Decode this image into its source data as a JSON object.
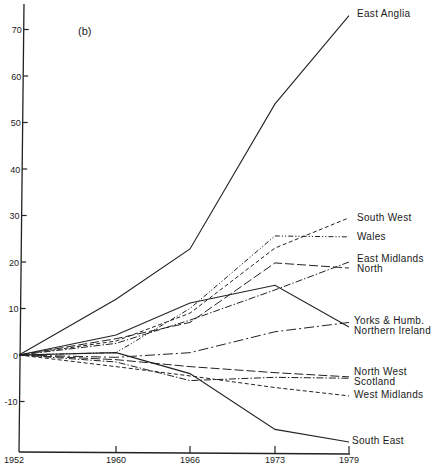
{
  "chart_data": {
    "type": "line",
    "title": "(b)",
    "xlabel": "",
    "ylabel": "",
    "x": [
      1952,
      1960,
      1966,
      1973,
      1979
    ],
    "xticks": [
      "1952",
      "1960",
      "1966",
      "1973",
      "1979"
    ],
    "yticks": [
      -10,
      0,
      10,
      20,
      30,
      40,
      50,
      60,
      70
    ],
    "ylim": [
      -20,
      76
    ],
    "grid": false,
    "legend_position": "inline-right",
    "series": [
      {
        "name": "East Anglia",
        "style": "solid",
        "values": [
          0,
          12,
          22.8,
          54,
          73
        ]
      },
      {
        "name": "South West",
        "style": "dashed-short",
        "values": [
          0,
          3,
          9,
          23,
          29.5
        ]
      },
      {
        "name": "Wales",
        "style": "dash-dot-dot",
        "values": [
          0,
          0.5,
          10,
          25.6,
          25.4
        ]
      },
      {
        "name": "East Midlands",
        "style": "dash-dot",
        "values": [
          0,
          2.5,
          7.5,
          14,
          20
        ]
      },
      {
        "name": "North",
        "style": "long-dash",
        "values": [
          0,
          3.5,
          7,
          19.8,
          18.7
        ]
      },
      {
        "name": "Yorks & Humb.",
        "style": "dash-dot-long",
        "values": [
          0,
          -0.5,
          0.5,
          5,
          7
        ]
      },
      {
        "name": "Northern Ireland",
        "style": "solid",
        "values": [
          0,
          4.3,
          11.2,
          15,
          6
        ]
      },
      {
        "name": "North West",
        "style": "long-dash",
        "values": [
          0,
          -1,
          -2.5,
          -3.8,
          -4.7
        ]
      },
      {
        "name": "Scotland",
        "style": "dash-dot",
        "values": [
          0,
          -1.5,
          -5.5,
          -4.8,
          -5
        ]
      },
      {
        "name": "West Midlands",
        "style": "dashed-short",
        "values": [
          0,
          -2.5,
          -4.5,
          -7,
          -8.8
        ]
      },
      {
        "name": "South East",
        "style": "solid",
        "values": [
          0,
          0.5,
          -4,
          -16,
          -18.7
        ]
      }
    ]
  },
  "labels": {
    "panel": "(b)"
  }
}
